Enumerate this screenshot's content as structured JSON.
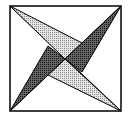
{
  "diagram": {
    "square": {
      "x1": 10,
      "y1": 6,
      "x2": 121,
      "y2": 111
    },
    "center": [
      65,
      59
    ],
    "colors": {
      "stroke": "#000000",
      "light_fill": "#cfcfcf",
      "dark_fill": "#555555",
      "background": "#ffffff"
    },
    "blades": [
      {
        "name": "top-left-light",
        "points": "10,6 65,59 82,43",
        "shade": "light"
      },
      {
        "name": "bottom-right-light",
        "points": "121,111 65,59 48,75",
        "shade": "light"
      },
      {
        "name": "top-right-dark",
        "points": "121,6 65,59 82,72",
        "shade": "dark"
      },
      {
        "name": "bottom-left-dark",
        "points": "10,111 65,59 48,46",
        "shade": "dark"
      }
    ]
  }
}
